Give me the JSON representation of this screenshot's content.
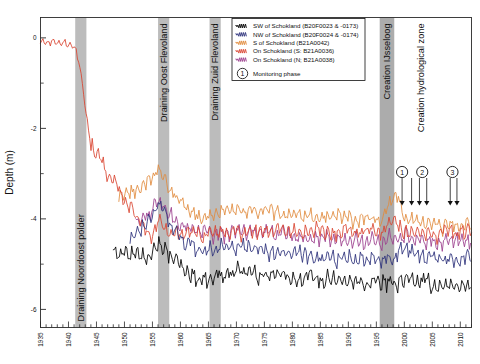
{
  "chart_data": {
    "type": "line",
    "title": "",
    "xlabel": "",
    "ylabel": "Depth (m)",
    "xlim": [
      1935,
      2012
    ],
    "ylim": [
      -6.4,
      0.45
    ],
    "yticks": [
      0,
      -2,
      -4,
      -6
    ],
    "ytick_labels": [
      "0",
      "-2",
      "-4",
      "-6"
    ],
    "yminor": [
      -1,
      -3,
      -5
    ],
    "xticks": [
      1935,
      1940,
      1945,
      1950,
      1955,
      1960,
      1965,
      1970,
      1975,
      1980,
      1985,
      1990,
      1995,
      2000,
      2005,
      2010
    ],
    "xtick_labels": [
      "1935",
      "1940",
      "1945",
      "1950",
      "1955",
      "1960",
      "1965",
      "1970",
      "1975",
      "1980",
      "1985",
      "1990",
      "1995",
      "2000",
      "2005",
      "2010"
    ],
    "xminor_step": 1,
    "grid": false,
    "legend_position": "top-right",
    "series": [
      {
        "name": "SW of Schokland (B20F0023 & -0173)",
        "color": "#000000",
        "start_year": 1948,
        "anchors": [
          [
            1948,
            -4.62
          ],
          [
            1950,
            -4.7
          ],
          [
            1952,
            -4.78
          ],
          [
            1954,
            -4.72
          ],
          [
            1956,
            -4.55
          ],
          [
            1958,
            -4.8
          ],
          [
            1960,
            -5.02
          ],
          [
            1962,
            -5.22
          ],
          [
            1964,
            -5.34
          ],
          [
            1966,
            -5.3
          ],
          [
            1968,
            -5.22
          ],
          [
            1972,
            -5.2
          ],
          [
            1976,
            -5.26
          ],
          [
            1980,
            -5.3
          ],
          [
            1984,
            -5.34
          ],
          [
            1988,
            -5.38
          ],
          [
            1992,
            -5.42
          ],
          [
            1996,
            -5.44
          ],
          [
            1998,
            -5.4
          ],
          [
            2000,
            -5.36
          ],
          [
            2002,
            -5.4
          ],
          [
            2006,
            -5.46
          ],
          [
            2010,
            -5.48
          ],
          [
            2012,
            -5.46
          ]
        ],
        "noise": 0.13
      },
      {
        "name": "NW of Schokland (B20F0024 & -0174)",
        "color": "#2b2f7a",
        "start_year": 1951,
        "anchors": [
          [
            1951,
            -4.42
          ],
          [
            1953,
            -4.2
          ],
          [
            1955,
            -3.9
          ],
          [
            1956,
            -3.62
          ],
          [
            1957,
            -3.7
          ],
          [
            1958,
            -4.08
          ],
          [
            1960,
            -4.4
          ],
          [
            1962,
            -4.6
          ],
          [
            1964,
            -4.72
          ],
          [
            1966,
            -4.66
          ],
          [
            1968,
            -4.62
          ],
          [
            1972,
            -4.66
          ],
          [
            1976,
            -4.72
          ],
          [
            1980,
            -4.76
          ],
          [
            1984,
            -4.82
          ],
          [
            1988,
            -4.86
          ],
          [
            1992,
            -4.9
          ],
          [
            1996,
            -4.92
          ],
          [
            1998,
            -4.86
          ],
          [
            2000,
            -4.62
          ],
          [
            2002,
            -4.78
          ],
          [
            2006,
            -4.86
          ],
          [
            2010,
            -4.88
          ],
          [
            2012,
            -4.86
          ]
        ],
        "noise": 0.12
      },
      {
        "name": "S of Schokland (B21A0042)",
        "color": "#e08a3c",
        "start_year": 1949,
        "anchors": [
          [
            1949,
            -3.52
          ],
          [
            1951,
            -3.44
          ],
          [
            1953,
            -3.3
          ],
          [
            1955,
            -3.12
          ],
          [
            1956,
            -2.92
          ],
          [
            1957,
            -3.02
          ],
          [
            1958,
            -3.38
          ],
          [
            1960,
            -3.66
          ],
          [
            1962,
            -3.84
          ],
          [
            1964,
            -3.94
          ],
          [
            1966,
            -3.88
          ],
          [
            1968,
            -3.86
          ],
          [
            1972,
            -3.84
          ],
          [
            1976,
            -3.86
          ],
          [
            1980,
            -3.9
          ],
          [
            1984,
            -3.94
          ],
          [
            1988,
            -3.98
          ],
          [
            1992,
            -4.02
          ],
          [
            1994,
            -4.04
          ],
          [
            1996,
            -4.0
          ],
          [
            1997,
            -3.74
          ],
          [
            1998,
            -3.52
          ],
          [
            1999,
            -3.58
          ],
          [
            2000,
            -3.96
          ],
          [
            2002,
            -4.06
          ],
          [
            2006,
            -4.12
          ],
          [
            2010,
            -4.14
          ],
          [
            2012,
            -4.08
          ]
        ],
        "noise": 0.11
      },
      {
        "name": "On Schokland (S: B21A0036)",
        "color": "#d9432f",
        "start_year": 1935,
        "anchors": [
          [
            1935,
            -0.12
          ],
          [
            1937,
            -0.1
          ],
          [
            1939,
            -0.14
          ],
          [
            1941,
            -0.16
          ],
          [
            1942,
            -0.55
          ],
          [
            1943,
            -1.55
          ],
          [
            1944,
            -2.35
          ],
          [
            1945,
            -2.62
          ],
          [
            1946,
            -2.78
          ],
          [
            1947,
            -3.0
          ],
          [
            1948,
            -3.22
          ],
          [
            1950,
            -3.6
          ],
          [
            1952,
            -3.96
          ],
          [
            1954,
            -4.26
          ],
          [
            1955,
            -4.4
          ],
          [
            1956,
            -4.1
          ],
          [
            1957,
            -4.22
          ],
          [
            1958,
            -4.32
          ],
          [
            1960,
            -4.36
          ],
          [
            1962,
            -4.34
          ],
          [
            1964,
            -4.34
          ],
          [
            1968,
            -4.32
          ],
          [
            1972,
            -4.3
          ],
          [
            1976,
            -4.28
          ],
          [
            1980,
            -4.28
          ],
          [
            1984,
            -4.28
          ],
          [
            1988,
            -4.28
          ],
          [
            1992,
            -4.26
          ],
          [
            1996,
            -4.26
          ],
          [
            1997,
            -4.1
          ],
          [
            1998,
            -4.04
          ],
          [
            2000,
            -4.26
          ],
          [
            2002,
            -4.3
          ],
          [
            2006,
            -4.34
          ],
          [
            2010,
            -4.34
          ],
          [
            2012,
            -4.3
          ]
        ],
        "noise": 0.12
      },
      {
        "name": "On Schokland (N; B21A0038)",
        "color": "#9b3d8c",
        "start_year": 1952,
        "anchors": [
          [
            1952,
            -4.02
          ],
          [
            1954,
            -3.98
          ],
          [
            1955,
            -3.84
          ],
          [
            1956,
            -3.58
          ],
          [
            1957,
            -3.7
          ],
          [
            1958,
            -4.0
          ],
          [
            1960,
            -4.16
          ],
          [
            1962,
            -4.26
          ],
          [
            1964,
            -4.34
          ],
          [
            1966,
            -4.3
          ],
          [
            1968,
            -4.28
          ],
          [
            1972,
            -4.3
          ],
          [
            1976,
            -4.34
          ],
          [
            1980,
            -4.38
          ],
          [
            1984,
            -4.42
          ],
          [
            1988,
            -4.46
          ],
          [
            1992,
            -4.5
          ],
          [
            1996,
            -4.52
          ],
          [
            1998,
            -4.4
          ],
          [
            2000,
            -4.3
          ],
          [
            2002,
            -4.44
          ],
          [
            2006,
            -4.52
          ],
          [
            2010,
            -4.54
          ],
          [
            2012,
            -4.5
          ]
        ],
        "noise": 0.12
      }
    ],
    "bands": [
      {
        "label": "Draining Noordoost polder",
        "start": 1941.2,
        "end": 1943.2,
        "color": "#b8b8b8",
        "label_anchor": "bottom"
      },
      {
        "label": "Draining Oost Flevoland",
        "start": 1956.0,
        "end": 1958.0,
        "color": "#b8b8b8",
        "label_anchor": "top"
      },
      {
        "label": "Draining Zuid Flevoland",
        "start": 1965.2,
        "end": 1967.2,
        "color": "#b8b8b8",
        "label_anchor": "top"
      },
      {
        "label": "Creation IJsseloog",
        "start": 1995.6,
        "end": 1998.2,
        "color": "#a8a8a8",
        "label_anchor": "top"
      }
    ],
    "annotations": [
      {
        "label": "Creation hydrological zone",
        "year": 2003.0,
        "type": "text-vertical"
      }
    ],
    "markers": [
      {
        "number": "1",
        "year": 1999.6,
        "arrows": [
          1999.6,
          2001.3
        ]
      },
      {
        "number": "2",
        "year": 2003.2,
        "arrows": [
          2002.7,
          2004.0
        ]
      },
      {
        "number": "3",
        "year": 2008.6,
        "arrows": [
          2008.2,
          2009.4
        ]
      }
    ],
    "legend": {
      "items": [
        {
          "label": "SW of Schokland (B20F0023 & -0173)",
          "color": "#000000"
        },
        {
          "label": "NW of Schokland (B20F0024 & -0174)",
          "color": "#2b2f7a"
        },
        {
          "label": "S of Schokland (B21A0042)",
          "color": "#e08a3c"
        },
        {
          "label": "On Schokland (S: B21A0036)",
          "color": "#d9432f"
        },
        {
          "label": "On Schokland (N; B21A0038)",
          "color": "#9b3d8c"
        }
      ],
      "phase_label": "Monitoring phase",
      "phase_symbol": "1"
    }
  }
}
